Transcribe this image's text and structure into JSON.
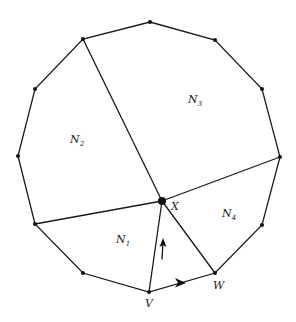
{
  "diagram": {
    "regions": [
      {
        "id": "N1",
        "name": "N",
        "sub": "1"
      },
      {
        "id": "N2",
        "name": "N",
        "sub": "2"
      },
      {
        "id": "N3",
        "name": "N",
        "sub": "3"
      },
      {
        "id": "N4",
        "name": "N",
        "sub": "4"
      }
    ],
    "points": {
      "X": "X",
      "V": "V",
      "W": "W"
    },
    "arrows": [
      {
        "edge": "V-X",
        "direction": "up"
      },
      {
        "edge": "V-W",
        "direction": "right"
      }
    ],
    "colors": {
      "stroke": "#1a1a1a",
      "background": "#ffffff"
    }
  }
}
